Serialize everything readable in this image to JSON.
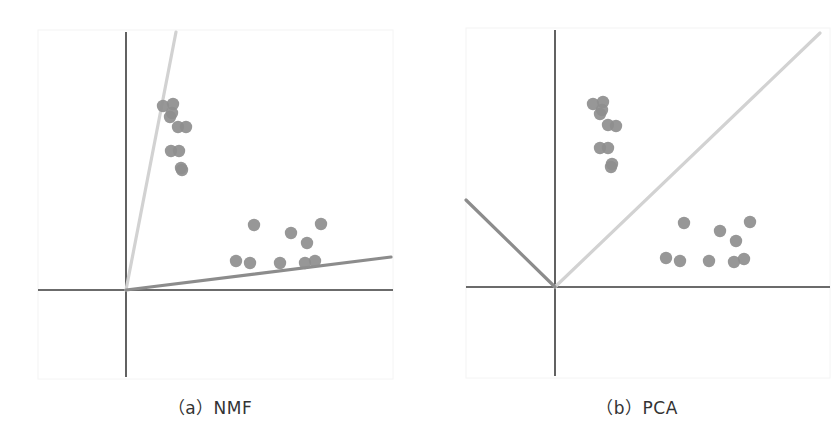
{
  "figure": {
    "panels": [
      {
        "id": "nmf",
        "caption": "（a）NMF",
        "method": "NMF"
      },
      {
        "id": "pca",
        "caption": "（b）PCA",
        "method": "PCA"
      }
    ],
    "colors": {
      "axis": "#3a3a3a",
      "basis_light": "#d2d2d2",
      "basis_dark": "#8c8c8c",
      "points": "#8e8e8e",
      "background": "#ffffff"
    }
  },
  "chart_data": [
    {
      "type": "scatter",
      "title": "（a）NMF",
      "xlabel": "",
      "ylabel": "",
      "grid": false,
      "origin_px": [
        126,
        290
      ],
      "basis_vectors": [
        {
          "name": "basis-1 (light)",
          "from": [
            126,
            290
          ],
          "to": [
            176,
            32
          ]
        },
        {
          "name": "basis-2 (dark)",
          "from": [
            126,
            290
          ],
          "to": [
            391,
            257
          ]
        }
      ],
      "series": [
        {
          "name": "cluster-upper",
          "points_px": [
            [
              163,
              106
            ],
            [
              173,
              104
            ],
            [
              172,
              113
            ],
            [
              170,
              117
            ],
            [
              178,
              127
            ],
            [
              186,
              127
            ],
            [
              171,
              151
            ],
            [
              179,
              151
            ],
            [
              182,
              170
            ],
            [
              181,
              168
            ]
          ]
        },
        {
          "name": "cluster-lower",
          "points_px": [
            [
              236,
              261
            ],
            [
              250,
              263
            ],
            [
              280,
              263
            ],
            [
              305,
              263
            ],
            [
              315,
              261
            ],
            [
              254,
              225
            ],
            [
              291,
              233
            ],
            [
              307,
              243
            ],
            [
              321,
              224
            ]
          ]
        }
      ]
    },
    {
      "type": "scatter",
      "title": "（b）PCA",
      "xlabel": "",
      "ylabel": "",
      "grid": false,
      "origin_px": [
        555,
        287
      ],
      "basis_vectors": [
        {
          "name": "basis-1 (light)",
          "from": [
            555,
            287
          ],
          "to": [
            820,
            33
          ]
        },
        {
          "name": "basis-2 (dark)",
          "from": [
            555,
            287
          ],
          "to": [
            466,
            200
          ]
        }
      ],
      "series": [
        {
          "name": "cluster-upper",
          "points_px": [
            [
              593,
              104
            ],
            [
              603,
              102
            ],
            [
              602,
              110
            ],
            [
              600,
              114
            ],
            [
              608,
              125
            ],
            [
              616,
              126
            ],
            [
              600,
              148
            ],
            [
              608,
              148
            ],
            [
              611,
              167
            ],
            [
              612,
              164
            ]
          ]
        },
        {
          "name": "cluster-lower",
          "points_px": [
            [
              666,
              258
            ],
            [
              680,
              261
            ],
            [
              709,
              261
            ],
            [
              734,
              262
            ],
            [
              744,
              259
            ],
            [
              684,
              223
            ],
            [
              720,
              231
            ],
            [
              736,
              241
            ],
            [
              750,
              222
            ]
          ]
        }
      ]
    }
  ]
}
